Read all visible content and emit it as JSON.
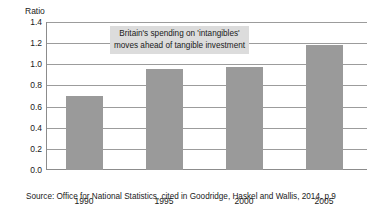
{
  "chart_data": {
    "type": "bar",
    "title": "",
    "subtitle": "",
    "xlabel": "",
    "ylabel": "Ratio",
    "categories": [
      "1990",
      "1995",
      "2000",
      "2005"
    ],
    "values": [
      0.7,
      0.96,
      0.97,
      1.18
    ],
    "series": [
      {
        "name": "Ratio of intangible to tangible investment",
        "values": [
          0.7,
          0.96,
          0.97,
          1.18
        ]
      }
    ],
    "ylim": [
      0.0,
      1.4
    ],
    "ytick_labels": [
      "0.0",
      "0.2",
      "0.4",
      "0.6",
      "0.8",
      "1.0",
      "1.2",
      "1.4"
    ],
    "ytick_values": [
      0.0,
      0.2,
      0.4,
      0.6,
      0.8,
      1.0,
      1.2,
      1.4
    ],
    "grid": true,
    "legend": "none",
    "bar_color": "#9a9a9a",
    "grid_color": "#9c9c9c",
    "axis_color": "#8c8c8c",
    "annotations": [
      {
        "line1": "Britain's spending on 'intangibles'",
        "line2": "moves ahead of tangible investment",
        "background": "#dcdcdc"
      }
    ],
    "source": "Source: Office for National Statistics, cited in Goodridge, Haskel and Wallis, 2014, p 9"
  }
}
